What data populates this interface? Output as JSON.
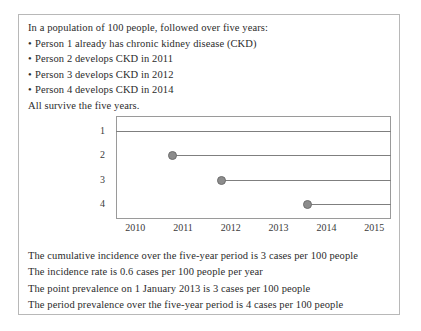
{
  "figure": {
    "scenario": {
      "intro": "In a population of 100 people, followed over five years:",
      "bullet_marker": "•",
      "bullets": [
        "Person 1 already has chronic kidney disease (CKD)",
        "Person 2 develops CKD in 2011",
        "Person 3 develops CKD in 2012",
        "Person 4 develops CKD in 2014"
      ],
      "closing": "All survive the five years."
    },
    "conclusions": [
      "The cumulative incidence over the five-year period is 3 cases per 100 people",
      "The incidence rate is 0.6 cases per 100 people per year",
      "The point prevalence on 1 January 2013 is 3 cases per 100 people",
      "The period prevalence over the five-year period is 4 cases per 100 people"
    ],
    "colors": {
      "outer_border": "#b8b8b8",
      "plot_border": "#9a9a9a",
      "line": "#7f7f7f",
      "marker_fill": "#8c8c8c",
      "marker_edge": "#6e6e6e",
      "text": "#2b2b2b"
    }
  },
  "chart_data": {
    "type": "line",
    "title": "",
    "xlabel": "",
    "ylabel": "",
    "xlim": [
      2009.6,
      2015.35
    ],
    "ylim": [
      0.4,
      4.6
    ],
    "grid": false,
    "legend": null,
    "x_ticks": [
      2010,
      2011,
      2012,
      2013,
      2014,
      2015
    ],
    "x_tick_labels": [
      "2010",
      "2011",
      "2012",
      "2013",
      "2014",
      "2015"
    ],
    "y_ticks": [
      1,
      2,
      3,
      4
    ],
    "y_tick_labels": [
      "1",
      "2",
      "3",
      "4"
    ],
    "series": [
      {
        "name": "Person 1",
        "person": 1,
        "onset_year": null,
        "onset_label": "already has CKD",
        "start_x": 2009.6,
        "end_x": 2015.35,
        "y": 1,
        "marker": false
      },
      {
        "name": "Person 2",
        "person": 2,
        "onset_year": 2011,
        "onset_label": "develops CKD in 2011",
        "start_x": 2010.78,
        "end_x": 2015.35,
        "y": 2,
        "marker": true
      },
      {
        "name": "Person 3",
        "person": 3,
        "onset_year": 2012,
        "onset_label": "develops CKD in 2012",
        "start_x": 2011.8,
        "end_x": 2015.35,
        "y": 3,
        "marker": true
      },
      {
        "name": "Person 4",
        "person": 4,
        "onset_year": 2014,
        "onset_label": "develops CKD in 2014",
        "start_x": 2013.6,
        "end_x": 2015.35,
        "y": 4,
        "marker": true
      }
    ]
  }
}
